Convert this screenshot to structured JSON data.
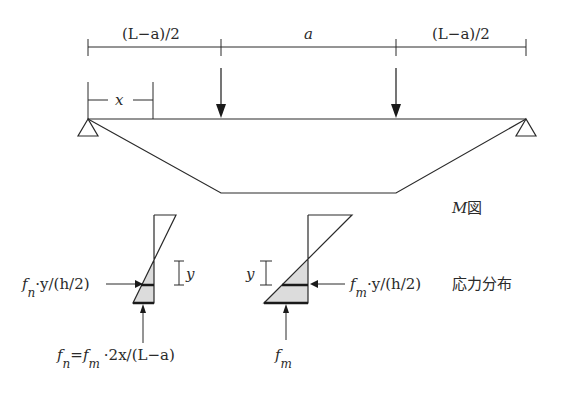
{
  "diagram": {
    "dimensions": {
      "left_span": "(L−a)/2",
      "middle_span": "a",
      "right_span": "(L−a)/2",
      "x_label": "x"
    },
    "moment_diagram_label": "M図",
    "moment_diagram_label_parts": {
      "symbol": "M",
      "suffix": "図"
    },
    "stress_section_left": {
      "arrow_label_main": "f",
      "arrow_label_sub": "n",
      "arrow_label_rest": "·y/(h/2)",
      "y_label": "y",
      "bottom_label": {
        "f1": "f",
        "f1_sub": "n",
        "eq": "=",
        "f2": "f",
        "f2_sub": "m",
        "rest": "·2x/(L−a)"
      }
    },
    "stress_section_right": {
      "arrow_label_main": "f",
      "arrow_label_sub": "m",
      "arrow_label_rest": "·y/(h/2)",
      "y_label": "y",
      "bottom_label_main": "f",
      "bottom_label_sub": "m"
    },
    "stress_distribution_caption": "応力分布",
    "colors": {
      "line": "#2a2a2a",
      "fill": "#dcdcdc"
    }
  }
}
